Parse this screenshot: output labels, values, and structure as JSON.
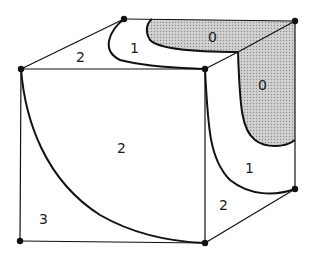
{
  "diagram": {
    "type": "cube-contour-map",
    "colors": {
      "stroke": "#111111",
      "shade": "#c8c8c8",
      "background": "#ffffff"
    },
    "regions": [
      {
        "id": "top-left-2",
        "label": "2"
      },
      {
        "id": "top-middle-1",
        "label": "1"
      },
      {
        "id": "top-right-0",
        "label": "0",
        "shaded": true
      },
      {
        "id": "right-upper-0",
        "label": "0",
        "shaded": true
      },
      {
        "id": "right-middle-1",
        "label": "1"
      },
      {
        "id": "front-center-2",
        "label": "2"
      },
      {
        "id": "front-lower-left-3",
        "label": "3"
      },
      {
        "id": "right-lower-2",
        "label": "2"
      }
    ]
  }
}
